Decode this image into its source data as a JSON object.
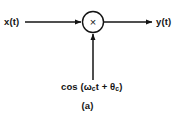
{
  "figure": {
    "caption": "(a)",
    "type": "block-diagram"
  },
  "labels": {
    "input": "x(t)",
    "output": "y(t)",
    "multiplier_symbol": "×"
  },
  "carrier": {
    "prefix": "cos (",
    "omega": "ω",
    "omega_sub": "c",
    "t": "t",
    "plus": " + ",
    "theta": "θ",
    "theta_sub": "c",
    "suffix": ")",
    "full_text": "cos (ωc t + θc)"
  },
  "colors": {
    "background": "#ffffff",
    "stroke": "#141414",
    "text": "#141414"
  }
}
